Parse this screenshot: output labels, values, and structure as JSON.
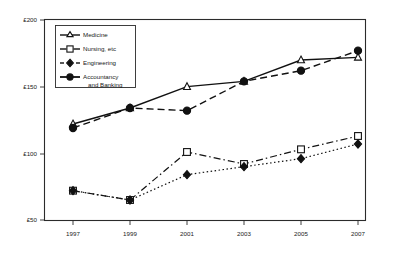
{
  "chart_data": {
    "type": "line",
    "title": "",
    "xlabel": "",
    "ylabel": "",
    "x": [
      "1997",
      "1999",
      "2001",
      "2003",
      "2005",
      "2007"
    ],
    "categories": [
      "1997",
      "1999",
      "2001",
      "2003",
      "2005",
      "2007"
    ],
    "ytick_labels": [
      "£50",
      "£100",
      "£150",
      "£200"
    ],
    "ytick_values": [
      50,
      100,
      150,
      200
    ],
    "ylim": [
      50,
      200
    ],
    "grid": false,
    "legend_position": "top-left",
    "currency": "£",
    "series": [
      {
        "name": "Medicine",
        "marker": "triangle-open",
        "line_style": "solid",
        "color": "#111111",
        "values": [
          122,
          134,
          150,
          154,
          170,
          172
        ]
      },
      {
        "name": "Nursing, etc",
        "marker": "square-open",
        "line_style": "dash-dot",
        "color": "#111111",
        "values": [
          72,
          65,
          101,
          92,
          103,
          113
        ]
      },
      {
        "name": "Engineering",
        "marker": "diamond-solid",
        "line_style": "dotted",
        "color": "#111111",
        "values": [
          72,
          65,
          84,
          90,
          96,
          107
        ]
      },
      {
        "name": "Accountancy and Banking",
        "marker": "circle-solid",
        "line_style": "dashed",
        "color": "#111111",
        "values": [
          119,
          134,
          132,
          154,
          162,
          177
        ]
      }
    ]
  },
  "legend": {
    "entries": [
      {
        "label": "Medicine"
      },
      {
        "label": "Nursing, etc"
      },
      {
        "label": "Engineering"
      },
      {
        "label": "Accountancy",
        "label2": "and Banking"
      }
    ]
  },
  "axes": {
    "y_labels": [
      "£200",
      "£150",
      "£100",
      "£50"
    ],
    "x_labels": [
      "1997",
      "1999",
      "2001",
      "2003",
      "2005",
      "2007"
    ]
  }
}
